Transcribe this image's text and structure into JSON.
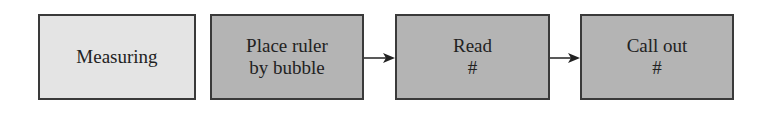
{
  "diagram": {
    "type": "flowchart",
    "nodes": [
      {
        "id": "measuring",
        "lines": [
          "Measuring"
        ],
        "style": "light"
      },
      {
        "id": "place",
        "lines": [
          "Place ruler",
          "by bubble"
        ],
        "style": "dark"
      },
      {
        "id": "read",
        "lines": [
          "Read",
          "#"
        ],
        "style": "dark"
      },
      {
        "id": "callout",
        "lines": [
          "Call out",
          "#"
        ],
        "style": "dark"
      }
    ],
    "edges": [
      {
        "from": "place",
        "to": "read"
      },
      {
        "from": "read",
        "to": "callout"
      }
    ],
    "colors": {
      "light_fill": "#e4e4e4",
      "dark_fill": "#b4b4b4",
      "border": "#3a3a3a"
    }
  }
}
